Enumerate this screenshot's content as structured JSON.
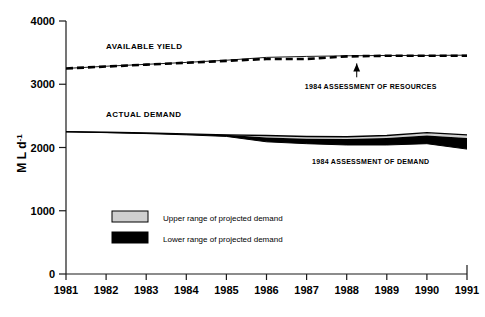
{
  "chart_data": {
    "type": "line",
    "title": "",
    "xlabel": "",
    "ylabel": "M L d-1",
    "ylabel_base": "M L d",
    "ylabel_exponent": "-1",
    "xlim": [
      1981,
      1991
    ],
    "ylim": [
      0,
      4000
    ],
    "grid": false,
    "legend_position": "inside-lower-left",
    "x": [
      1981,
      1982,
      1983,
      1984,
      1985,
      1986,
      1987,
      1988,
      1989,
      1990,
      1991
    ],
    "xticklabels": [
      "1981",
      "1982",
      "1983",
      "1984",
      "1985",
      "1986",
      "1987",
      "1988",
      "1989",
      "1990",
      "1991"
    ],
    "yticks": [
      0,
      1000,
      2000,
      3000,
      4000
    ],
    "yticklabels": [
      "0",
      "1000",
      "2000",
      "3000",
      "4000"
    ],
    "series": [
      {
        "name": "Available yield (1984 assessment of resources)",
        "style": "dashed",
        "values": [
          3250,
          3280,
          3310,
          3340,
          3370,
          3400,
          3400,
          3440,
          3450,
          3450,
          3450
        ]
      },
      {
        "name": "Available yield (upper solid envelope)",
        "style": "solid-thin",
        "values": [
          3250,
          3285,
          3315,
          3345,
          3380,
          3425,
          3440,
          3450,
          3455,
          3455,
          3460
        ]
      },
      {
        "name": "Actual demand",
        "style": "solid",
        "values": [
          2250,
          2240,
          2230,
          2215,
          2200,
          2190,
          2175,
          2170,
          2190,
          2235,
          2200
        ]
      },
      {
        "name": "Upper range of projected demand",
        "style": "band-gray",
        "values": [
          2250,
          2240,
          2230,
          2215,
          2200,
          2160,
          2140,
          2135,
          2150,
          2190,
          2150
        ]
      },
      {
        "name": "Lower range of projected demand",
        "style": "band-black",
        "values": [
          2250,
          2235,
          2220,
          2200,
          2175,
          2090,
          2060,
          2040,
          2040,
          2060,
          1975
        ]
      }
    ],
    "annotations": [
      {
        "text": "AVAILABLE YIELD",
        "x": 1982.0,
        "y": 3560,
        "anchor": "start"
      },
      {
        "text": "ACTUAL DEMAND",
        "x": 1982.0,
        "y": 2480,
        "anchor": "start"
      },
      {
        "text": "1984 ASSESSMENT OF RESOURCES",
        "x": 1988.6,
        "y": 2920,
        "anchor": "middle",
        "has_arrow": true
      },
      {
        "text": "1984 ASSESSMENT OF DEMAND",
        "x": 1988.6,
        "y": 1740,
        "anchor": "middle",
        "has_arrow": false
      }
    ],
    "legend": {
      "items": [
        {
          "label": "Upper range of projected demand",
          "color": "#cfcfcf",
          "border": "#000000"
        },
        {
          "label": "Lower range of projected demand",
          "color": "#000000",
          "border": "#000000"
        }
      ]
    },
    "colors": {
      "axis": "#1a1a1a",
      "line": "#000000",
      "upper_band": "#cfcfcf",
      "lower_band": "#000000",
      "background": "#ffffff"
    }
  }
}
